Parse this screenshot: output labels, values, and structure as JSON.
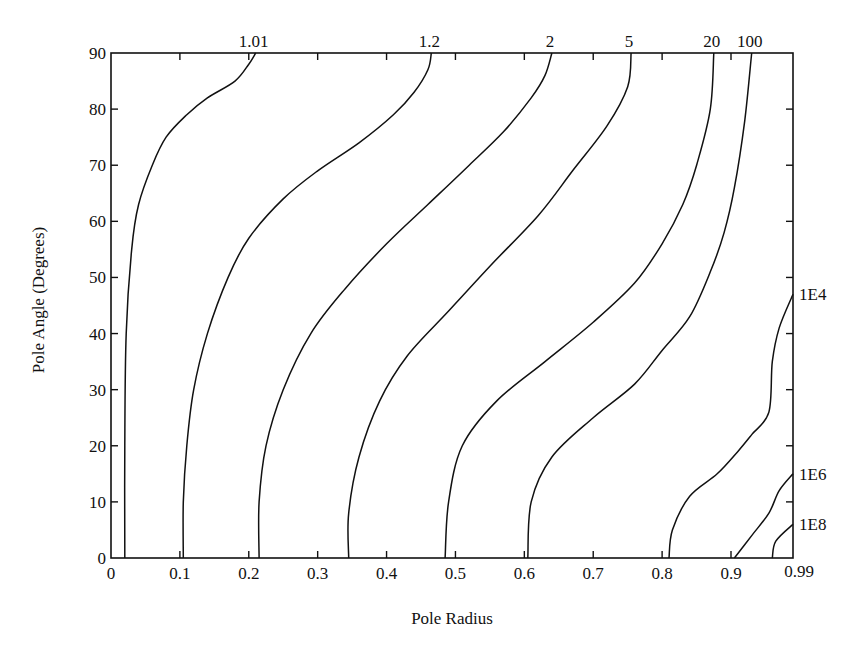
{
  "chart_data": {
    "type": "contour",
    "title": "",
    "xlabel": "Pole Radius",
    "ylabel": "Pole Angle (Degrees)",
    "xlim": [
      0,
      0.99
    ],
    "ylim": [
      0,
      90
    ],
    "x_ticks": [
      0,
      0.1,
      0.2,
      0.3,
      0.4,
      0.5,
      0.6,
      0.7,
      0.8,
      0.9
    ],
    "x_tick_labels": [
      "0",
      "0.1",
      "0.2",
      "0.3",
      "0.4",
      "0.5",
      "0.6",
      "0.7",
      "0.8",
      "0.9",
      "0.99"
    ],
    "y_ticks": [
      0,
      10,
      20,
      30,
      40,
      50,
      60,
      70,
      80,
      90
    ],
    "y_tick_labels": [
      "0",
      "10",
      "20",
      "30",
      "40",
      "50",
      "60",
      "70",
      "80",
      "90"
    ],
    "grid": false,
    "legend": null,
    "contours": [
      {
        "level": "1.01",
        "label_position": "top",
        "points": [
          [
            0.02,
            0
          ],
          [
            0.02,
            20
          ],
          [
            0.022,
            40
          ],
          [
            0.03,
            55
          ],
          [
            0.04,
            63
          ],
          [
            0.06,
            70
          ],
          [
            0.08,
            75
          ],
          [
            0.11,
            79
          ],
          [
            0.14,
            82
          ],
          [
            0.18,
            85
          ],
          [
            0.2,
            88
          ],
          [
            0.21,
            90
          ]
        ]
      },
      {
        "level": "1.2",
        "label_position": "top",
        "points": [
          [
            0.105,
            0
          ],
          [
            0.105,
            10
          ],
          [
            0.11,
            20
          ],
          [
            0.12,
            30
          ],
          [
            0.14,
            40
          ],
          [
            0.17,
            50
          ],
          [
            0.2,
            57
          ],
          [
            0.25,
            64
          ],
          [
            0.3,
            69
          ],
          [
            0.36,
            74
          ],
          [
            0.41,
            79
          ],
          [
            0.44,
            83
          ],
          [
            0.46,
            87
          ],
          [
            0.465,
            90
          ]
        ]
      },
      {
        "level": "2",
        "label_position": "top",
        "points": [
          [
            0.215,
            0
          ],
          [
            0.215,
            10
          ],
          [
            0.225,
            20
          ],
          [
            0.25,
            30
          ],
          [
            0.29,
            40
          ],
          [
            0.34,
            48
          ],
          [
            0.4,
            56
          ],
          [
            0.46,
            63
          ],
          [
            0.52,
            70
          ],
          [
            0.57,
            76
          ],
          [
            0.61,
            82
          ],
          [
            0.63,
            86
          ],
          [
            0.64,
            90
          ]
        ]
      },
      {
        "level": "5",
        "label_position": "top",
        "points": [
          [
            0.345,
            0
          ],
          [
            0.345,
            8
          ],
          [
            0.36,
            18
          ],
          [
            0.39,
            28
          ],
          [
            0.43,
            36
          ],
          [
            0.49,
            44
          ],
          [
            0.55,
            52
          ],
          [
            0.62,
            61
          ],
          [
            0.67,
            69
          ],
          [
            0.72,
            77
          ],
          [
            0.75,
            84
          ],
          [
            0.755,
            90
          ]
        ]
      },
      {
        "level": "20",
        "label_position": "top",
        "points": [
          [
            0.485,
            0
          ],
          [
            0.49,
            10
          ],
          [
            0.51,
            20
          ],
          [
            0.56,
            28
          ],
          [
            0.63,
            35
          ],
          [
            0.7,
            42
          ],
          [
            0.76,
            49
          ],
          [
            0.8,
            56
          ],
          [
            0.83,
            63
          ],
          [
            0.85,
            70
          ],
          [
            0.87,
            80
          ],
          [
            0.875,
            90
          ]
        ]
      },
      {
        "level": "100",
        "label_position": "top",
        "points": [
          [
            0.605,
            0
          ],
          [
            0.61,
            10
          ],
          [
            0.64,
            18
          ],
          [
            0.7,
            25
          ],
          [
            0.76,
            31
          ],
          [
            0.8,
            37
          ],
          [
            0.84,
            43
          ],
          [
            0.87,
            51
          ],
          [
            0.89,
            58
          ],
          [
            0.905,
            66
          ],
          [
            0.92,
            78
          ],
          [
            0.93,
            90
          ]
        ]
      },
      {
        "level": "1E4",
        "label_position": "right",
        "points": [
          [
            0.81,
            0
          ],
          [
            0.815,
            5
          ],
          [
            0.84,
            11
          ],
          [
            0.88,
            15
          ],
          [
            0.91,
            19
          ],
          [
            0.93,
            22
          ],
          [
            0.955,
            26
          ],
          [
            0.96,
            35
          ],
          [
            0.97,
            41
          ],
          [
            0.99,
            47
          ]
        ]
      },
      {
        "level": "1E6",
        "label_position": "right",
        "points": [
          [
            0.905,
            0
          ],
          [
            0.93,
            4
          ],
          [
            0.955,
            8
          ],
          [
            0.97,
            12
          ],
          [
            0.99,
            15
          ]
        ]
      },
      {
        "level": "1E8",
        "label_position": "right",
        "points": [
          [
            0.96,
            0
          ],
          [
            0.965,
            3
          ],
          [
            0.99,
            6
          ]
        ]
      }
    ]
  }
}
